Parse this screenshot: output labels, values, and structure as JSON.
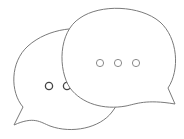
{
  "illustration": {
    "name": "two speech bubbles with ellipsis",
    "stroke_color": "#7a7a7a",
    "dot_color_back": "#444444",
    "dot_color_front": "#8a8a8a",
    "fill_color": "#ffffff",
    "back_bubble": {
      "dots": 3,
      "visible_dots": 2
    },
    "front_bubble": {
      "dots": 3
    }
  }
}
